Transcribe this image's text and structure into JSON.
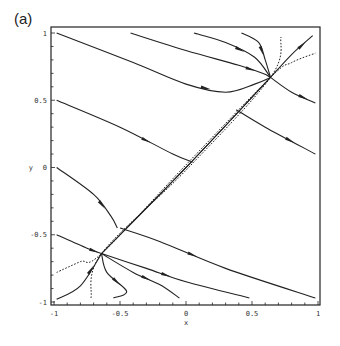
{
  "figure": {
    "panel_label": "(a)"
  },
  "chart_data": {
    "type": "line",
    "title": "",
    "panel_label": "(a)",
    "xlabel": "x",
    "ylabel": "y",
    "xlim": [
      -1,
      1
    ],
    "ylim": [
      -1,
      1
    ],
    "x_ticks": [
      "-1",
      "-0.5",
      "0",
      "0.5",
      "1"
    ],
    "y_ticks": [
      "1",
      "0.5",
      "0",
      "-0.5",
      "-1"
    ],
    "grid": false,
    "legend": null,
    "equilibria": [
      {
        "x": 0.64,
        "y": 0.67
      },
      {
        "x": -0.64,
        "y": -0.64
      }
    ],
    "series": [
      {
        "name": "trajectory-1",
        "style": "solid",
        "points": [
          [
            -0.98,
            1.0
          ],
          [
            -0.4,
            0.78
          ],
          [
            0.0,
            0.62
          ],
          [
            0.3,
            0.56
          ],
          [
            0.52,
            0.62
          ],
          [
            0.64,
            0.67
          ]
        ]
      },
      {
        "name": "trajectory-2",
        "style": "solid",
        "points": [
          [
            -0.42,
            1.0
          ],
          [
            0.0,
            0.87
          ],
          [
            0.4,
            0.76
          ],
          [
            0.58,
            0.7
          ],
          [
            0.64,
            0.67
          ]
        ]
      },
      {
        "name": "trajectory-3",
        "style": "solid",
        "points": [
          [
            0.06,
            1.0
          ],
          [
            0.3,
            0.93
          ],
          [
            0.52,
            0.82
          ],
          [
            0.64,
            0.67
          ]
        ]
      },
      {
        "name": "trajectory-4",
        "style": "solid",
        "points": [
          [
            0.42,
            1.0
          ],
          [
            0.55,
            0.93
          ],
          [
            0.6,
            0.8
          ],
          [
            0.64,
            0.67
          ]
        ]
      },
      {
        "name": "trajectory-5",
        "style": "solid",
        "points": [
          [
            0.64,
            0.67
          ],
          [
            0.8,
            0.84
          ],
          [
            0.96,
            0.98
          ]
        ]
      },
      {
        "name": "trajectory-6",
        "style": "solid",
        "points": [
          [
            0.64,
            0.67
          ],
          [
            0.8,
            0.56
          ],
          [
            0.98,
            0.48
          ]
        ]
      },
      {
        "name": "trajectory-7",
        "style": "solid",
        "points": [
          [
            -0.98,
            0.5
          ],
          [
            -0.5,
            0.3
          ],
          [
            -0.1,
            0.1
          ],
          [
            0.05,
            0.04
          ]
        ]
      },
      {
        "name": "trajectory-8",
        "style": "solid",
        "points": [
          [
            -0.98,
            0.0
          ],
          [
            -0.7,
            -0.2
          ],
          [
            -0.57,
            -0.36
          ],
          [
            -0.52,
            -0.45
          ]
        ]
      },
      {
        "name": "trajectory-9",
        "style": "solid",
        "points": [
          [
            0.38,
            0.43
          ],
          [
            0.6,
            0.3
          ],
          [
            0.98,
            0.1
          ]
        ]
      },
      {
        "name": "trajectory-10",
        "style": "solid",
        "points": [
          [
            -0.5,
            -0.45
          ],
          [
            -0.2,
            -0.55
          ],
          [
            0.3,
            -0.75
          ],
          [
            0.98,
            -0.97
          ]
        ]
      },
      {
        "name": "trajectory-11",
        "style": "solid",
        "points": [
          [
            -0.64,
            -0.64
          ],
          [
            -0.3,
            -0.75
          ],
          [
            0.0,
            -0.85
          ],
          [
            0.48,
            -0.97
          ]
        ]
      },
      {
        "name": "trajectory-12",
        "style": "solid",
        "points": [
          [
            -0.64,
            -0.64
          ],
          [
            -0.4,
            -0.78
          ],
          [
            -0.2,
            -0.87
          ],
          [
            -0.05,
            -0.97
          ]
        ]
      },
      {
        "name": "trajectory-13",
        "style": "solid",
        "points": [
          [
            -0.98,
            -0.5
          ],
          [
            -0.75,
            -0.6
          ],
          [
            -0.64,
            -0.64
          ]
        ]
      },
      {
        "name": "trajectory-14",
        "style": "solid",
        "points": [
          [
            -0.64,
            -0.64
          ],
          [
            -0.6,
            -0.78
          ],
          [
            -0.45,
            -0.92
          ],
          [
            -0.55,
            -0.97
          ]
        ]
      },
      {
        "name": "trajectory-15",
        "style": "solid",
        "points": [
          [
            -0.98,
            -0.98
          ],
          [
            -0.8,
            -0.88
          ],
          [
            -0.64,
            -0.64
          ]
        ]
      },
      {
        "name": "diagonal-bundle",
        "style": "solid",
        "points": [
          [
            -0.64,
            -0.64
          ],
          [
            0.0,
            0.0
          ],
          [
            0.64,
            0.67
          ]
        ]
      },
      {
        "name": "separatrix-dotted-1",
        "style": "dotted",
        "points": [
          [
            -0.98,
            -0.78
          ],
          [
            -0.8,
            -0.7
          ],
          [
            -0.64,
            -0.64
          ],
          [
            0.0,
            0.02
          ],
          [
            0.64,
            0.67
          ],
          [
            0.8,
            0.78
          ],
          [
            0.98,
            0.85
          ]
        ]
      },
      {
        "name": "separatrix-dotted-2",
        "style": "dotted",
        "points": [
          [
            -0.72,
            -0.97
          ],
          [
            -0.64,
            -0.64
          ],
          [
            0.0,
            -0.02
          ],
          [
            0.64,
            0.67
          ],
          [
            0.72,
            0.97
          ]
        ]
      }
    ]
  }
}
